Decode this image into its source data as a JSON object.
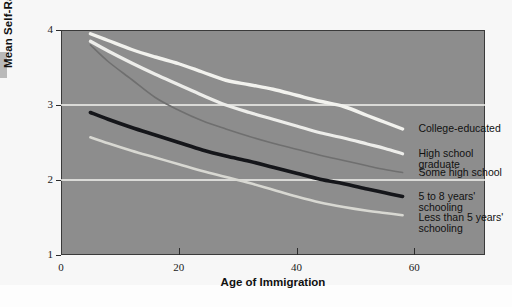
{
  "chart_data": {
    "type": "line",
    "title": "",
    "xlabel": "Age of Immigration",
    "ylabel": "Mean Self-Rated English Proficiency",
    "xlim": [
      0,
      72
    ],
    "ylim": [
      1,
      4
    ],
    "xticks": [
      0,
      20,
      40,
      60
    ],
    "yticks": [
      1,
      2,
      3,
      4
    ],
    "grid": "horizontal gridlines at y=2 and y=3, white",
    "legend_position": "inline-right-of-lines",
    "plot_background": "#8d8d8d",
    "series": [
      {
        "name": "College-educated",
        "color": "#f2f2ee",
        "width": 3.4,
        "x": [
          5,
          8,
          12,
          16,
          20,
          24,
          28,
          32,
          36,
          40,
          44,
          48,
          52,
          55,
          58
        ],
        "values": [
          3.95,
          3.86,
          3.74,
          3.64,
          3.55,
          3.44,
          3.33,
          3.27,
          3.21,
          3.13,
          3.05,
          2.98,
          2.86,
          2.77,
          2.68
        ]
      },
      {
        "name": "High school graduate",
        "color": "#ededea",
        "width": 3.2,
        "x": [
          5,
          8,
          12,
          16,
          20,
          24,
          28,
          32,
          36,
          40,
          44,
          48,
          52,
          55,
          58
        ],
        "values": [
          3.85,
          3.72,
          3.56,
          3.41,
          3.27,
          3.13,
          3.0,
          2.9,
          2.81,
          2.72,
          2.63,
          2.56,
          2.48,
          2.42,
          2.35
        ]
      },
      {
        "name": "Some high school",
        "color": "#6f6f6f",
        "width": 1.6,
        "x": [
          5,
          8,
          12,
          16,
          20,
          24,
          28,
          32,
          36,
          40,
          44,
          48,
          52,
          55,
          58
        ],
        "values": [
          3.8,
          3.58,
          3.34,
          3.1,
          2.93,
          2.79,
          2.68,
          2.58,
          2.49,
          2.41,
          2.33,
          2.26,
          2.19,
          2.14,
          2.1
        ]
      },
      {
        "name": "5 to 8 years' schooling",
        "color": "#15161a",
        "width": 3.6,
        "x": [
          5,
          8,
          12,
          16,
          20,
          24,
          28,
          32,
          36,
          40,
          44,
          48,
          52,
          55,
          58
        ],
        "values": [
          2.9,
          2.81,
          2.7,
          2.6,
          2.5,
          2.4,
          2.32,
          2.25,
          2.17,
          2.09,
          2.01,
          1.95,
          1.88,
          1.83,
          1.78
        ]
      },
      {
        "name": "Less than 5 years' schooling",
        "color": "#d8d8d2",
        "width": 2.6,
        "x": [
          5,
          8,
          12,
          16,
          20,
          24,
          28,
          32,
          36,
          40,
          44,
          48,
          52,
          55,
          58
        ],
        "values": [
          2.57,
          2.49,
          2.39,
          2.3,
          2.21,
          2.12,
          2.04,
          1.96,
          1.87,
          1.78,
          1.7,
          1.64,
          1.59,
          1.56,
          1.53
        ]
      }
    ],
    "annotations": [
      {
        "text": "College-educated",
        "at_x": 59,
        "at_y": 2.68
      },
      {
        "text": "High school graduate",
        "at_x": 59,
        "at_y": 2.35
      },
      {
        "text": "Some high school",
        "at_x": 59,
        "at_y": 2.1
      },
      {
        "text": "5 to 8 years' schooling",
        "at_x": 59,
        "at_y": 1.78
      },
      {
        "text": "Less than 5 years'\nschooling",
        "at_x": 59,
        "at_y": 1.5
      }
    ]
  },
  "axes": {
    "y_title": "Mean Self-Rated English Proficiency",
    "x_title": "Age of Immigration",
    "y_tick_labels": [
      "4",
      "3",
      "2",
      "1"
    ],
    "x_tick_labels": [
      "0",
      "20",
      "40",
      "60"
    ]
  },
  "labels": {
    "college": "College-educated",
    "hs_grad": "High school graduate",
    "some_hs": "Some high school",
    "five_eight": "5 to 8 years' schooling",
    "less_five": "Less than 5 years'\nschooling"
  }
}
